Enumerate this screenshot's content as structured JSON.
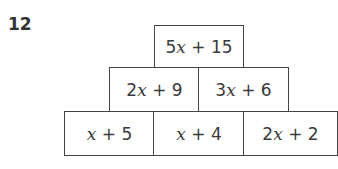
{
  "question": {
    "number": "12"
  },
  "pyramid": {
    "rows": [
      {
        "row": "top",
        "cells": [
          {
            "coef": "5",
            "var": "x",
            "rest": " + 15"
          }
        ]
      },
      {
        "row": "middle",
        "cells": [
          {
            "coef": "2",
            "var": "x",
            "rest": " + 9"
          },
          {
            "coef": "3",
            "var": "x",
            "rest": " + 6"
          }
        ]
      },
      {
        "row": "bottom",
        "cells": [
          {
            "coef": "",
            "var": "x",
            "rest": " + 5"
          },
          {
            "coef": "",
            "var": "x",
            "rest": " + 4"
          },
          {
            "coef": "2",
            "var": "x",
            "rest": " + 2"
          }
        ]
      }
    ]
  }
}
